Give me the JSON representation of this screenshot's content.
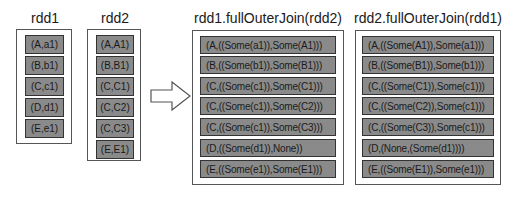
{
  "panels": [
    {
      "title": "rdd1",
      "items": [
        "(A,a1)",
        "(B,b1)",
        "(C,c1)",
        "(D,d1)",
        "(E,e1)"
      ]
    },
    {
      "title": "rdd2",
      "items": [
        "(A,A1)",
        "(B,B1)",
        "(C,C1)",
        "(C,C2)",
        "(C,C3)",
        "(E,E1)"
      ]
    },
    {
      "title": "rdd1.fullOuterJoin(rdd2)",
      "items": [
        "(A,((Some(a1)),Some(A1)))",
        "(B,((Some(b1)),Some(B1)))",
        "(C,((Some(c1)),Some(C1)))",
        "(C,((Some(c1)),Some(C2)))",
        "(C,((Some(c1)),Some(C3)))",
        "(D,((Some(d1)),None))",
        "(E,((Some(e1)),Some(E1)))"
      ]
    },
    {
      "title": "rdd2.fullOuterJoin(rdd1)",
      "items": [
        "(A,((Some(A1)),Some(a1)))",
        "(B,((Some(B1)),Some(b1)))",
        "(C,((Some(C1)),Some(c1)))",
        "(C,((Some(C2)),Some(c1)))",
        "(C,((Some(C3)),Some(c1)))",
        "(D,(None,(Some(d1))))",
        "(E,((Some(E1)),Some(e1)))"
      ]
    }
  ],
  "arrow": {
    "icon": "right-arrow-icon",
    "direction": "right"
  }
}
